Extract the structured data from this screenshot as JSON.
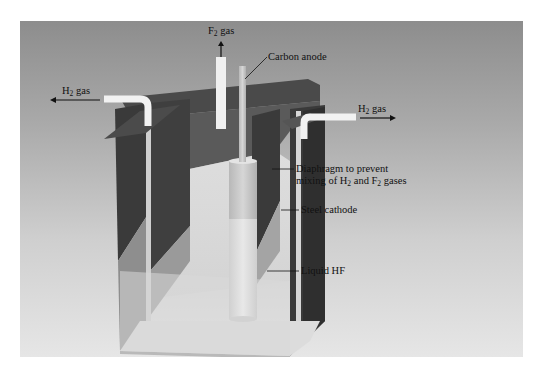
{
  "figure": {
    "labels": {
      "f2_gas": {
        "prefix": "F",
        "sub": "2",
        "suffix": " gas"
      },
      "h2_gas_left": {
        "prefix": "H",
        "sub": "2",
        "suffix": " gas"
      },
      "h2_gas_right": {
        "prefix": "H",
        "sub": "2",
        "suffix": " gas"
      },
      "carbon_anode": "Carbon anode",
      "diaphragm_line1": "Diaphragm to prevent",
      "diaphragm_line2_a": "mixing of H",
      "diaphragm_line2_sub1": "2",
      "diaphragm_line2_b": " and F",
      "diaphragm_line2_sub2": "2",
      "diaphragm_line2_c": " gases",
      "steel_cathode": "Steel cathode",
      "liquid_hf": "Liquid HF"
    },
    "colors": {
      "background_top": "#8d8d8d",
      "background_bottom": "#e6e6e6",
      "wall_dark": "#3c3c3c",
      "liquid": "#d9d9d9",
      "anode": "#c8c8c8",
      "tube": "#f2f2f2"
    }
  }
}
